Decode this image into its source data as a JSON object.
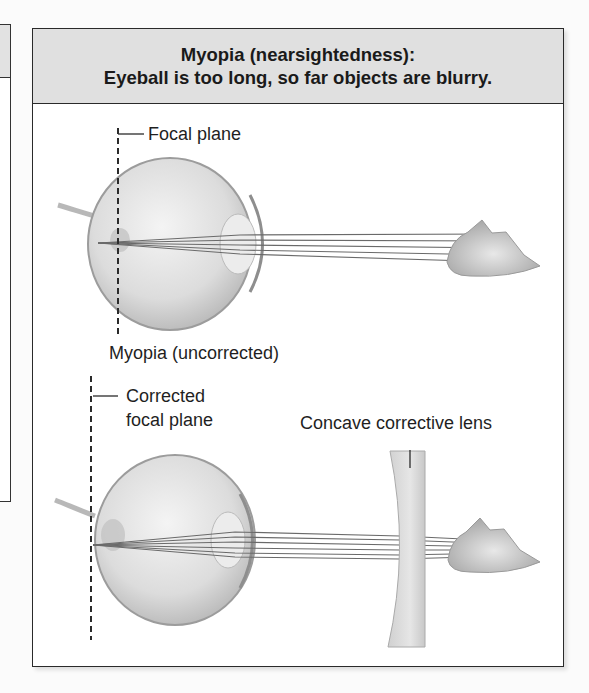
{
  "header": {
    "title_line1": "Myopia (nearsightedness):",
    "title_line2": "Eyeball is too long, so far objects are blurry."
  },
  "diagrams": [
    {
      "name": "uncorrected",
      "labels": {
        "focal_plane": "Focal plane",
        "caption": "Myopia (uncorrected)"
      }
    },
    {
      "name": "corrected",
      "labels": {
        "focal_plane_line1": "Corrected",
        "focal_plane_line2": "focal plane",
        "lens": "Concave corrective lens"
      }
    }
  ],
  "colors": {
    "header_bg": "#e0e0e0",
    "border": "#2a2a2a",
    "ray": "#6a6a6a",
    "eye": "#d9d9d9"
  }
}
